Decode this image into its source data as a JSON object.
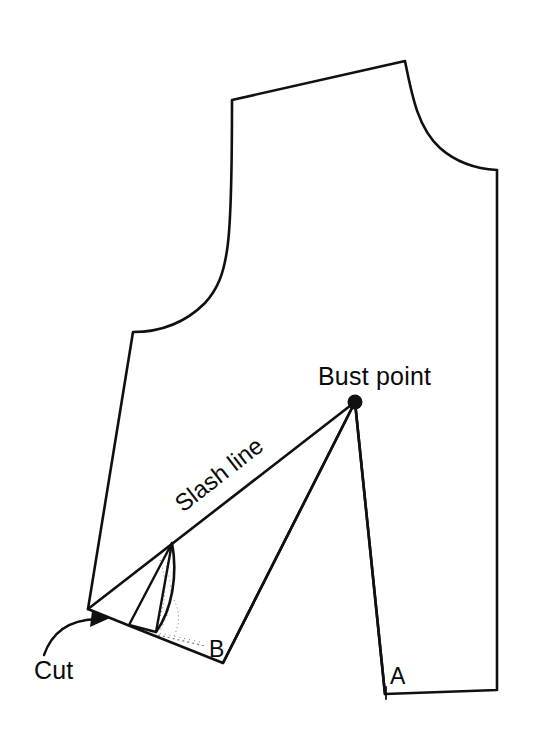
{
  "diagram": {
    "background_color": "#ffffff",
    "line_color": "#101010",
    "labels": {
      "bust_point": "Bust point",
      "slash_line": "Slash line",
      "cut": "Cut",
      "point_a": "A",
      "point_b": "B"
    },
    "points": {
      "bust_point": {
        "x": 355,
        "y": 402
      },
      "cut_apex": {
        "x": 88,
        "y": 609
      },
      "point_a": {
        "x": 385,
        "y": 694
      },
      "point_b": {
        "x": 223,
        "y": 663
      }
    },
    "geometry": {
      "bodice_outline": "M 232,100 L 405,61 C 412,96 418,128 440,148 C 457,163 478,169 497,170 L 497,690 L 385,694 L 355,402 L 223,663 L 130,626 L 88,609 L 133,332 C 162,332 186,322 205,303 C 230,276 232,240 232,100 Z",
      "slash_line": "M 88,609 L 355,402",
      "dart_leg_to_b": "M 355,402 L 223,663",
      "dart_leg_to_a": "M 355,402 L 385,694",
      "hem_line": "M 385,694 L 497,690",
      "wedge_fold": "M 172,543 L 156,632 L 129,625 Z",
      "wedge_curve": "M 172,543 C 178,575 172,610 156,632"
    },
    "annotations": {
      "cut_arrow": "curved arrow pointing up-right toward the cut apex"
    }
  }
}
